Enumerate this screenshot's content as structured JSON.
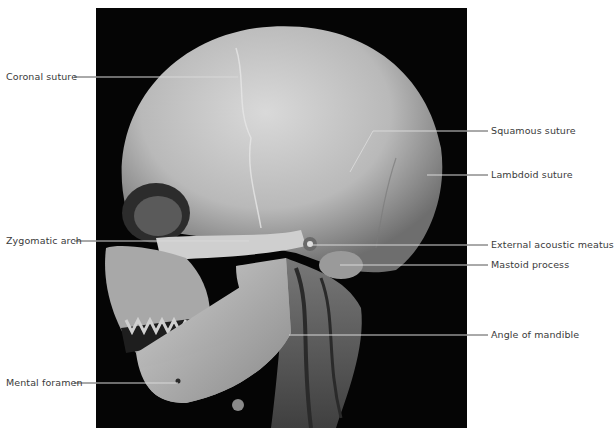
{
  "figure": {
    "background_color": "#ffffff",
    "scan_background_color": "#050505",
    "label_color": "#3a3a3a",
    "leader_color_outside": "#555555",
    "leader_color_inside": "#d8d8d8"
  },
  "labels": {
    "left": [
      {
        "id": "coronal-suture",
        "text": "Coronal suture"
      },
      {
        "id": "zygomatic-arch",
        "text": "Zygomatic arch"
      },
      {
        "id": "mental-foramen",
        "text": "Mental foramen"
      }
    ],
    "right": [
      {
        "id": "squamous-suture",
        "text": "Squamous suture"
      },
      {
        "id": "lambdoid-suture",
        "text": "Lambdoid suture"
      },
      {
        "id": "external-acoustic-meatus",
        "text": "External acoustic meatus"
      },
      {
        "id": "mastoid-process",
        "text": "Mastoid process"
      },
      {
        "id": "angle-of-mandible",
        "text": "Angle of mandible"
      }
    ]
  }
}
